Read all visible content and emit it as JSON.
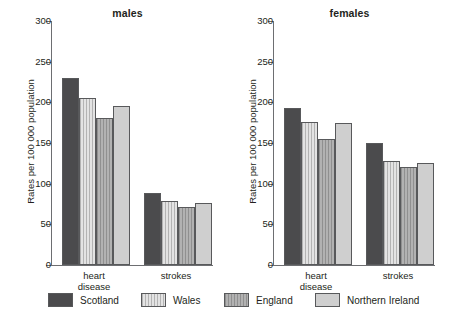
{
  "chart_data": {
    "type": "bar",
    "title": "",
    "panels": [
      {
        "title": "males",
        "categories": [
          "heart disease",
          "strokes"
        ],
        "series": [
          {
            "name": "Scotland",
            "values": [
              230,
              88
            ]
          },
          {
            "name": "Wales",
            "values": [
              205,
              79
            ]
          },
          {
            "name": "England",
            "values": [
              181,
              71
            ]
          },
          {
            "name": "Northern Ireland",
            "values": [
              196,
              76
            ]
          }
        ]
      },
      {
        "title": "females",
        "categories": [
          "heart disease",
          "strokes"
        ],
        "series": [
          {
            "name": "Scotland",
            "values": [
              193,
              150
            ]
          },
          {
            "name": "Wales",
            "values": [
              176,
              128
            ]
          },
          {
            "name": "England",
            "values": [
              155,
              121
            ]
          },
          {
            "name": "Northern Ireland",
            "values": [
              175,
              126
            ]
          }
        ]
      }
    ],
    "ylabel": "Rates per 100 000 population",
    "xlabel": "",
    "ylim": [
      0,
      300
    ],
    "yticks": [
      0,
      50,
      100,
      150,
      200,
      250,
      300
    ],
    "ytick_labels": [
      "0",
      "50",
      "100",
      "150",
      "200",
      "250",
      "300"
    ],
    "grid": false,
    "legend_position": "bottom",
    "legend": [
      {
        "label": "Scotland",
        "color": "#4b4b4d",
        "pattern": "solid"
      },
      {
        "label": "Wales",
        "color": "#e3e3e3",
        "pattern": "vertical-hatch"
      },
      {
        "label": "England",
        "color": "#b2b2b2",
        "pattern": "vertical-hatch"
      },
      {
        "label": "Northern Ireland",
        "color": "#cfcfcf",
        "pattern": "solid"
      }
    ]
  },
  "axis": {
    "line_color": "#6d6e71",
    "text_color": "#231f20"
  },
  "group_labels": {
    "heart_line1": "heart",
    "heart_line2": "disease",
    "strokes": "strokes"
  }
}
